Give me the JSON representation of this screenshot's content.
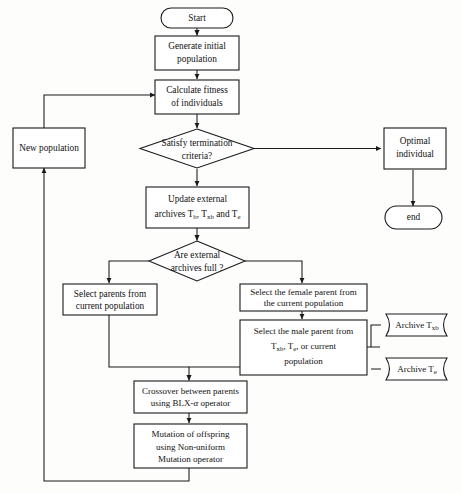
{
  "diagram": {
    "type": "flowchart",
    "colors": {
      "stroke": "#1a1a1a",
      "fill": "#ffffff",
      "background": "#fdfdfc"
    },
    "nodes": {
      "start": {
        "label": "Start",
        "shape": "terminator"
      },
      "generate": {
        "line1": "Generate initial",
        "line2": "population",
        "shape": "process"
      },
      "fitness": {
        "line1": "Calculate fitness",
        "line2": "of individuals",
        "shape": "process"
      },
      "terminate": {
        "line1": "Satisfy termination",
        "line2": "criteria?",
        "shape": "decision"
      },
      "optimal": {
        "line1": "Optimal",
        "line2": "individual",
        "shape": "process"
      },
      "end": {
        "label": "end",
        "shape": "terminator"
      },
      "newpop": {
        "label": "New population",
        "shape": "process"
      },
      "update": {
        "line1": "Update external",
        "line2_pre": "archives T",
        "line2_sub1": "b",
        "line2_mid": ", T",
        "line2_sub2": "xb",
        "line2_mid2": " and T",
        "line2_sub3": "e",
        "shape": "process"
      },
      "archfull": {
        "line1": "Are external",
        "line2": "archives full ?",
        "shape": "decision"
      },
      "selparents": {
        "line1": "Select parents from",
        "line2": "current population",
        "shape": "process"
      },
      "female": {
        "line1": "Select the female parent from",
        "line2": "the current population",
        "shape": "process"
      },
      "male": {
        "line1": "Select the male parent from",
        "line2_pre": "T",
        "line2_sub1": "xb",
        "line2_mid": ", T",
        "line2_sub2": "e",
        "line2_post": ", or current",
        "line3": "population",
        "shape": "process"
      },
      "crossover": {
        "line1": "Crossover between parents",
        "line2_pre": "using BLX-",
        "line2_alpha": "α",
        "line2_post": " operator",
        "shape": "process"
      },
      "mutation": {
        "line1": "Mutation of offspring",
        "line2": "using Non-uniform",
        "line3": "Mutation operator",
        "shape": "process"
      },
      "archive_txb": {
        "label_pre": "Archive T",
        "label_sub": "xb",
        "shape": "stored-data"
      },
      "archive_te": {
        "label_pre": "Archive T",
        "label_sub": "e",
        "shape": "stored-data"
      }
    },
    "edges": [
      {
        "from": "start",
        "to": "generate"
      },
      {
        "from": "generate",
        "to": "fitness"
      },
      {
        "from": "fitness",
        "to": "terminate"
      },
      {
        "from": "terminate",
        "to": "optimal"
      },
      {
        "from": "optimal",
        "to": "end"
      },
      {
        "from": "terminate",
        "to": "update"
      },
      {
        "from": "update",
        "to": "archfull"
      },
      {
        "from": "archfull",
        "to": "selparents"
      },
      {
        "from": "archfull",
        "to": "female"
      },
      {
        "from": "female",
        "to": "male"
      },
      {
        "from": "archive_txb",
        "to": "male"
      },
      {
        "from": "archive_te",
        "to": "male"
      },
      {
        "from": "selparents",
        "to": "crossover"
      },
      {
        "from": "male",
        "to": "crossover"
      },
      {
        "from": "crossover",
        "to": "mutation"
      },
      {
        "from": "mutation",
        "to": "newpop"
      },
      {
        "from": "newpop",
        "to": "fitness"
      }
    ]
  }
}
